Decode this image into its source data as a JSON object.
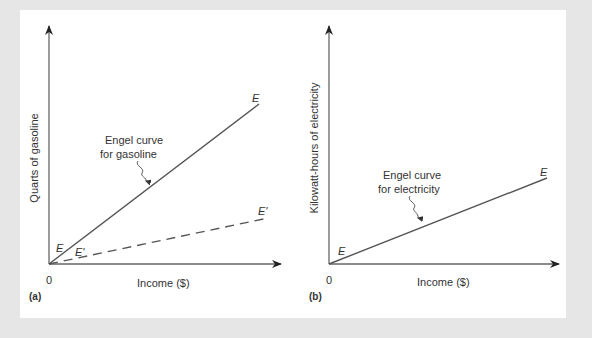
{
  "figure": {
    "background": "#e6e6e6",
    "panel_color": "#ffffff",
    "line_color": "#555555"
  },
  "panels": [
    {
      "id": "a",
      "tag": "(a)",
      "y_axis_label": "Quarts of gasoline",
      "x_axis_label": "Income ($)",
      "origin_label": "0",
      "annotation_line1": "Engel curve",
      "annotation_line2": "for gasoline",
      "curves": [
        {
          "name": "E",
          "style": "solid",
          "start_label": "E",
          "end_label": "E"
        },
        {
          "name": "E'",
          "style": "dashed",
          "start_label": "E'",
          "end_label": "E'"
        }
      ]
    },
    {
      "id": "b",
      "tag": "(b)",
      "y_axis_label": "Kilowatt-hours of electricity",
      "x_axis_label": "Income ($)",
      "origin_label": "0",
      "annotation_line1": "Engel curve",
      "annotation_line2": "for electricity",
      "curves": [
        {
          "name": "E",
          "style": "solid",
          "start_label": "E",
          "end_label": "E"
        }
      ]
    }
  ]
}
